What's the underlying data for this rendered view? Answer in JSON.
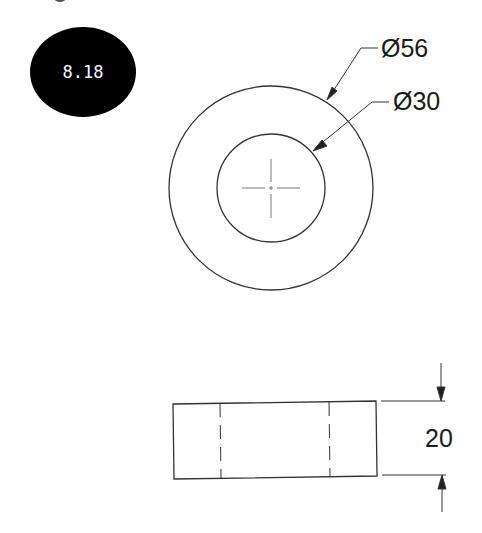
{
  "badge": {
    "label": "8.18",
    "fill": "#000000",
    "text_color": "#ffffff"
  },
  "top_view": {
    "outer_diameter_label": "Ø56",
    "inner_diameter_label": "Ø30"
  },
  "side_view": {
    "thickness_label": "20"
  },
  "colors": {
    "line": "#333333",
    "background": "#ffffff"
  }
}
